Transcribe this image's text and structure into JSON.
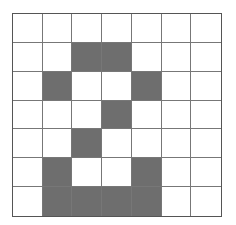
{
  "grid": {
    "rows": 7,
    "cols": 7,
    "filled_color": "#6e6e6e",
    "empty_color": "#ffffff",
    "line_color": "#777777",
    "cells": [
      [
        0,
        0,
        0,
        0,
        0,
        0,
        0
      ],
      [
        0,
        0,
        1,
        1,
        0,
        0,
        0
      ],
      [
        0,
        1,
        0,
        0,
        1,
        0,
        0
      ],
      [
        0,
        0,
        0,
        1,
        0,
        0,
        0
      ],
      [
        0,
        0,
        1,
        0,
        0,
        0,
        0
      ],
      [
        0,
        1,
        0,
        0,
        1,
        0,
        0
      ],
      [
        0,
        1,
        1,
        1,
        1,
        0,
        0
      ]
    ]
  }
}
